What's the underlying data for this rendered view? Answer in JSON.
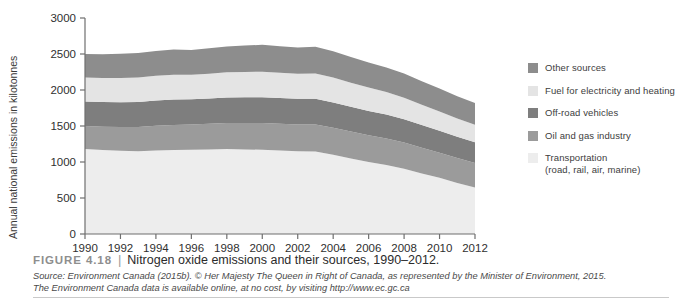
{
  "figure": {
    "number_label": "FIGURE 4.18",
    "divider": "|",
    "title": "Nitrogen oxide emissions and their sources, 1990–2012.",
    "source_line_1": "Source: Environment Canada (2015b). © Her Majesty The Queen in Right of Canada, as represented by the Minister of Environment, 2015.",
    "source_line_2": "The Environment Canada data is available online, at no cost, by visiting http://www.ec.gc.ca"
  },
  "legend": {
    "items": [
      {
        "label": "Other sources",
        "color": "#8d8d8d",
        "swatch_name": "legend-swatch-other-sources"
      },
      {
        "label": "Fuel for electricity and heating",
        "color": "#e4e4e4",
        "swatch_name": "legend-swatch-fuel-electricity-heating"
      },
      {
        "label": "Off-road vehicles",
        "color": "#7e7e7e",
        "swatch_name": "legend-swatch-off-road-vehicles"
      },
      {
        "label": "Oil and gas industry",
        "color": "#9b9b9b",
        "swatch_name": "legend-swatch-oil-and-gas-industry"
      },
      {
        "label": "Transportation\n(road, rail, air, marine)",
        "color": "#ededed",
        "swatch_name": "legend-swatch-transportation"
      }
    ]
  },
  "axes": {
    "y_axis_title": "Annual national emissions in kilotonnes",
    "y_ticks": [
      "0",
      "500",
      "1000",
      "1500",
      "2000",
      "2500",
      "3000"
    ],
    "x_ticks": [
      "1990",
      "1992",
      "1994",
      "1996",
      "1998",
      "2000",
      "2002",
      "2004",
      "2006",
      "2008",
      "2010",
      "2012"
    ]
  },
  "chart_data": {
    "type": "area",
    "title": "Nitrogen oxide emissions and their sources, 1990–2012.",
    "xlabel": "",
    "ylabel": "Annual national emissions in kilotonnes",
    "ylim": [
      0,
      3000
    ],
    "xlim": [
      1990,
      2012
    ],
    "ytick_step": 500,
    "grid": false,
    "stacked": true,
    "legend_position": "right",
    "units": "kilotonnes",
    "x": [
      1990,
      1991,
      1992,
      1993,
      1994,
      1995,
      1996,
      1997,
      1998,
      1999,
      2000,
      2001,
      2002,
      2003,
      2004,
      2005,
      2006,
      2007,
      2008,
      2009,
      2010,
      2011,
      2012
    ],
    "series": [
      {
        "name": "Transportation (road, rail, air, marine)",
        "color": "#ededed",
        "values": [
          1180,
          1165,
          1155,
          1150,
          1160,
          1165,
          1170,
          1175,
          1180,
          1175,
          1170,
          1160,
          1150,
          1145,
          1100,
          1050,
          1000,
          960,
          905,
          840,
          780,
          710,
          645
        ]
      },
      {
        "name": "Oil and gas industry",
        "color": "#9b9b9b",
        "values": [
          320,
          325,
          330,
          335,
          345,
          350,
          350,
          355,
          360,
          365,
          370,
          370,
          372,
          375,
          375,
          372,
          370,
          368,
          365,
          358,
          350,
          345,
          340
        ]
      },
      {
        "name": "Off-road vehicles",
        "color": "#7e7e7e",
        "values": [
          340,
          342,
          345,
          348,
          350,
          352,
          350,
          352,
          355,
          358,
          360,
          358,
          355,
          358,
          352,
          345,
          338,
          332,
          325,
          315,
          305,
          295,
          288
        ]
      },
      {
        "name": "Fuel for electricity and heating",
        "color": "#e4e4e4",
        "values": [
          335,
          335,
          338,
          340,
          342,
          345,
          342,
          345,
          350,
          352,
          355,
          352,
          350,
          352,
          345,
          335,
          325,
          312,
          298,
          282,
          268,
          255,
          245
        ]
      },
      {
        "name": "Other sources",
        "color": "#8d8d8d",
        "values": [
          325,
          330,
          335,
          340,
          345,
          350,
          345,
          352,
          360,
          368,
          372,
          368,
          362,
          370,
          365,
          358,
          350,
          342,
          335,
          325,
          318,
          308,
          300
        ]
      }
    ],
    "totals": [
      2500,
      2497,
      2503,
      2513,
      2542,
      2562,
      2557,
      2579,
      2605,
      2618,
      2627,
      2608,
      2589,
      2600,
      2537,
      2460,
      2383,
      2314,
      2228,
      2120,
      2021,
      1913,
      1818
    ]
  }
}
